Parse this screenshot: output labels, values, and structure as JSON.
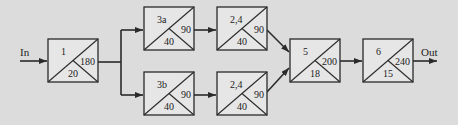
{
  "diagram": {
    "input_label": "In",
    "output_label": "Out",
    "colors": {
      "background": "#dcdcdc",
      "box_fill": "#e6e6e6",
      "stroke": "#2a2a2a"
    },
    "nodes": [
      {
        "id": "n1",
        "name": "1",
        "right": "180",
        "bottom": "20",
        "x": 48,
        "y": 39,
        "w": 50,
        "h": 43
      },
      {
        "id": "n3a",
        "name": "3a",
        "right": "90",
        "bottom": "40",
        "x": 144,
        "y": 7,
        "w": 50,
        "h": 43
      },
      {
        "id": "n24a",
        "name": "2,4",
        "right": "90",
        "bottom": "40",
        "x": 217,
        "y": 7,
        "w": 50,
        "h": 43
      },
      {
        "id": "n3b",
        "name": "3b",
        "right": "90",
        "bottom": "40",
        "x": 144,
        "y": 72,
        "w": 50,
        "h": 43
      },
      {
        "id": "n24b",
        "name": "2,4",
        "right": "90",
        "bottom": "40",
        "x": 217,
        "y": 72,
        "w": 50,
        "h": 43
      },
      {
        "id": "n5",
        "name": "5",
        "right": "200",
        "bottom": "18",
        "x": 290,
        "y": 39,
        "w": 50,
        "h": 43
      },
      {
        "id": "n6",
        "name": "6",
        "right": "240",
        "bottom": "15",
        "x": 363,
        "y": 39,
        "w": 50,
        "h": 43
      }
    ]
  }
}
